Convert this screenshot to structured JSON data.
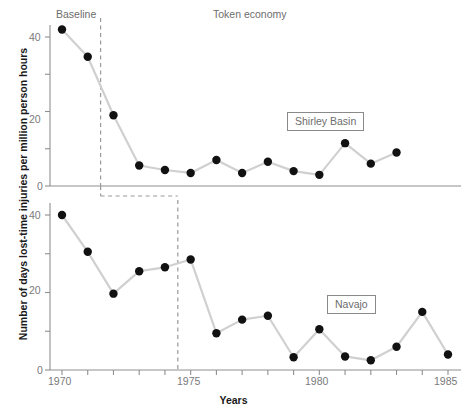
{
  "chart_data": {
    "type": "line",
    "title": "",
    "xlabel": "Years",
    "ylabel": "Number of days lost-time injuries per million person hours",
    "xlim": [
      1969.3,
      1985.6
    ],
    "xticks": [
      1970,
      1971,
      1972,
      1973,
      1974,
      1975,
      1976,
      1977,
      1978,
      1979,
      1980,
      1981,
      1982,
      1983,
      1984,
      1985
    ],
    "xticklabels": [
      "1970",
      "",
      "",
      "",
      "",
      "1975",
      "",
      "",
      "",
      "",
      "1980",
      "",
      "",
      "",
      "",
      "1985"
    ],
    "grid": false,
    "legend": "none",
    "marker": "filled-circle",
    "marker_color": "#111111",
    "line_color": "#d0d0d0",
    "panels": [
      {
        "name": "Shirley Basin",
        "label": "Shirley Basin",
        "ylim": [
          0,
          45
        ],
        "yticks": [
          0,
          10,
          20,
          30,
          40
        ],
        "yticklabels": [
          "0",
          "",
          "20",
          "",
          "40"
        ],
        "phase_divider_x": 1971.5,
        "phases": [
          {
            "label": "Baseline",
            "x": 1970.6
          },
          {
            "label": "Token economy",
            "x": 1977.9
          }
        ],
        "x": [
          1970,
          1971,
          1972,
          1973,
          1974,
          1975,
          1976,
          1977,
          1978,
          1979,
          1980,
          1981,
          1982,
          1983
        ],
        "values": [
          42.0,
          34.7,
          19.0,
          5.5,
          4.3,
          3.5,
          7.0,
          3.5,
          6.5,
          4.0,
          3.0,
          11.5,
          6.0,
          9.0
        ]
      },
      {
        "name": "Navajo",
        "label": "Navajo",
        "ylim": [
          0,
          45
        ],
        "yticks": [
          0,
          10,
          20,
          30,
          40
        ],
        "yticklabels": [
          "0",
          "",
          "20",
          "",
          "40"
        ],
        "phase_divider_x": 1974.5,
        "phases": [],
        "x": [
          1970,
          1971,
          1972,
          1973,
          1974,
          1975,
          1976,
          1977,
          1978,
          1979,
          1980,
          1981,
          1982,
          1983,
          1984,
          1985
        ],
        "values": [
          40.0,
          30.5,
          19.7,
          25.5,
          26.5,
          28.5,
          9.5,
          13.0,
          14.0,
          3.3,
          10.5,
          3.5,
          2.5,
          6.0,
          15.0,
          4.0
        ]
      }
    ],
    "annotations": [
      {
        "name": "baseline-phase-label",
        "text": "Baseline"
      },
      {
        "name": "token-economy-phase-label",
        "text": "Token economy"
      },
      {
        "name": "shirley-basin-series-label",
        "text": "Shirley Basin"
      },
      {
        "name": "navajo-series-label",
        "text": "Navajo"
      }
    ]
  },
  "axes": {
    "y_title": "Number of days lost-time injuries per million person hours",
    "x_title": "Years"
  },
  "labels": {
    "baseline": "Baseline",
    "token_economy": "Token economy",
    "shirley_basin": "Shirley Basin",
    "navajo": "Navajo"
  },
  "top_panel_yticks": [
    "40",
    "20",
    "0"
  ],
  "bottom_panel_yticks": [
    "40",
    "20",
    "0"
  ],
  "xticklabels": {
    "t1970": "1970",
    "t1975": "1975",
    "t1980": "1980",
    "t1985": "1985"
  }
}
